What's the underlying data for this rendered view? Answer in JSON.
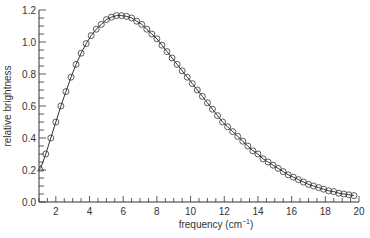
{
  "chart_data": {
    "type": "line",
    "title": "",
    "xlabel": "frequency (cm",
    "xlabel_sup": "−1",
    "xlabel_close": ")",
    "ylabel": "relative brightness",
    "xlim": [
      1,
      20
    ],
    "ylim": [
      0,
      1.2
    ],
    "xticks": [
      2,
      4,
      6,
      8,
      10,
      12,
      14,
      16,
      18,
      20
    ],
    "xtick_labels": [
      "2",
      "4",
      "6",
      "8",
      "10",
      "12",
      "14",
      "16",
      "18",
      "20"
    ],
    "yticks": [
      0.0,
      0.2,
      0.4,
      0.6,
      0.8,
      1.0,
      1.2
    ],
    "ytick_labels": [
      "0.0",
      "0.2",
      "0.4",
      "0.6",
      "0.8",
      "1.0",
      "1.2"
    ],
    "x_minor_step": 0.5,
    "y_minor_step": 0.05,
    "grid": false,
    "legend": null,
    "series": [
      {
        "name": "theory curve",
        "style": "solid line",
        "color": "#333333"
      },
      {
        "name": "measured data",
        "style": "open circle markers",
        "first_marker": "triangle",
        "color": "#333333",
        "x": [
          1.1,
          1.4,
          1.7,
          2.0,
          2.3,
          2.6,
          2.9,
          3.2,
          3.5,
          3.8,
          4.1,
          4.4,
          4.7,
          5.0,
          5.3,
          5.6,
          5.9,
          6.2,
          6.5,
          6.8,
          7.1,
          7.4,
          7.7,
          8.0,
          8.3,
          8.6,
          8.9,
          9.2,
          9.5,
          9.8,
          10.1,
          10.4,
          10.7,
          11.0,
          11.3,
          11.6,
          11.9,
          12.2,
          12.5,
          12.8,
          13.1,
          13.4,
          13.7,
          14.0,
          14.3,
          14.6,
          14.9,
          15.2,
          15.5,
          15.8,
          16.1,
          16.4,
          16.7,
          17.0,
          17.3,
          17.6,
          17.9,
          18.2,
          18.5,
          18.8,
          19.1,
          19.4,
          19.7
        ],
        "values": [
          0.21,
          0.3,
          0.4,
          0.5,
          0.6,
          0.69,
          0.78,
          0.86,
          0.93,
          0.99,
          1.04,
          1.08,
          1.11,
          1.14,
          1.155,
          1.165,
          1.165,
          1.16,
          1.15,
          1.13,
          1.11,
          1.08,
          1.05,
          1.02,
          0.98,
          0.94,
          0.9,
          0.86,
          0.82,
          0.78,
          0.74,
          0.7,
          0.66,
          0.62,
          0.58,
          0.54,
          0.5,
          0.47,
          0.44,
          0.41,
          0.38,
          0.35,
          0.32,
          0.3,
          0.27,
          0.25,
          0.23,
          0.21,
          0.19,
          0.17,
          0.155,
          0.14,
          0.125,
          0.11,
          0.1,
          0.09,
          0.08,
          0.07,
          0.065,
          0.055,
          0.05,
          0.045,
          0.04
        ]
      }
    ]
  },
  "colors": {
    "ink": "#333333",
    "background": "#ffffff"
  }
}
